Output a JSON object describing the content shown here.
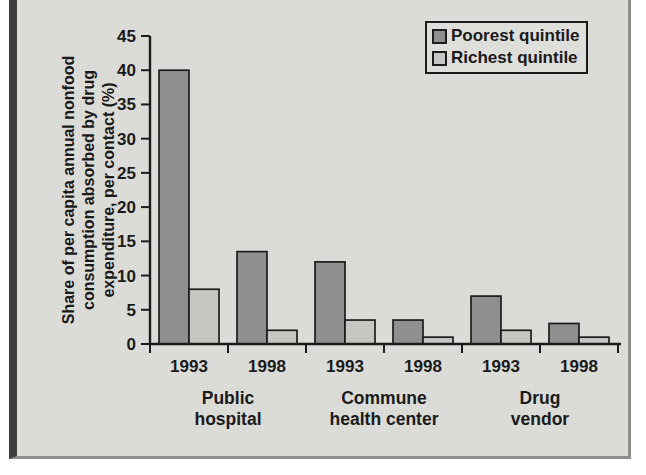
{
  "figure": {
    "page_bg": "#ffffff",
    "panel_bg": "#dbdbd7",
    "panel_border_color": "#8e8e8a",
    "left_rule_color": "#3f3f3d",
    "axis_color": "#1c1c1c",
    "text_color": "#1a1a1a"
  },
  "chart_data": {
    "type": "bar",
    "title": "",
    "ylabel_lines": [
      "Share of per capita annual nonfood",
      "consumption absorbed by drug",
      "expenditure, per contact (%)"
    ],
    "ylim": [
      0,
      45
    ],
    "ytick_step": 5,
    "grid": false,
    "legend_position": "top-right",
    "categories": [
      "1993",
      "1998",
      "1993",
      "1998",
      "1993",
      "1998"
    ],
    "group_labels": [
      [
        "Public",
        "hospital"
      ],
      [
        "Commune",
        "health center"
      ],
      [
        "Drug",
        "vendor"
      ]
    ],
    "series": [
      {
        "name": "Poorest quintile",
        "color": "#8f908e",
        "values": [
          40,
          13.5,
          12,
          3.5,
          7,
          3
        ]
      },
      {
        "name": "Richest quintile",
        "color": "#c6c7c2",
        "values": [
          8,
          2,
          3.5,
          1,
          2,
          1
        ]
      }
    ]
  }
}
